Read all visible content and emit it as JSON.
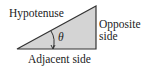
{
  "diagram": {
    "labels": {
      "hypotenuse": "Hypotenuse",
      "opposite_line1": "Opposite",
      "opposite_line2": "side",
      "adjacent": "Adjacent side",
      "angle": "θ"
    },
    "colors": {
      "fill": "#d4d4d4",
      "stroke": "#333333",
      "text": "#222222"
    }
  }
}
